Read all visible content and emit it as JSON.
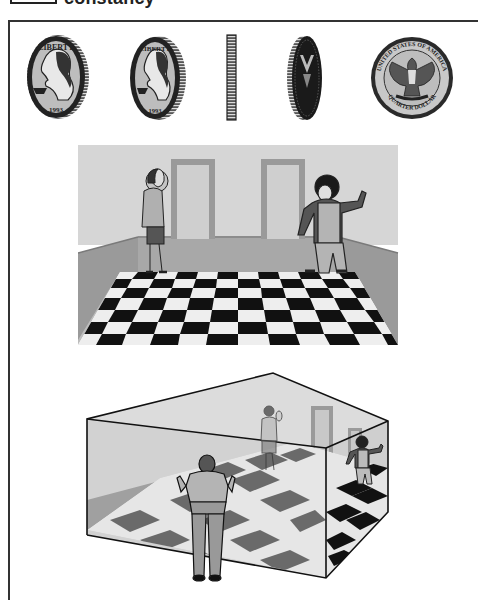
{
  "header": {
    "title": "constancy"
  },
  "figure": {
    "coins_panel": {
      "description": "Quarter dollar shown rotating from front view to edge to back view (shape constancy)",
      "coins": [
        {
          "view": "obverse-frontal",
          "inscription": "LIBERTY",
          "date": "1993"
        },
        {
          "view": "obverse-tilted",
          "inscription": "LIBERTY",
          "date": "1993"
        },
        {
          "view": "edge-on"
        },
        {
          "view": "reverse-tilted"
        },
        {
          "view": "reverse-frontal",
          "inscription_top": "UNITED STATES OF AMERICA",
          "inscription_bottom": "QUARTER DOLLAR"
        }
      ]
    },
    "room_panel": {
      "description": "Ames room as seen from viewing peephole: woman appears tiny, child appears giant",
      "figures": [
        "woman",
        "child"
      ]
    },
    "ames_room_panel": {
      "description": "Cutaway view of distorted Ames room with observer in foreground",
      "figures": [
        "observer",
        "woman",
        "child"
      ]
    }
  },
  "colors": {
    "ink": "#1a1a1a",
    "wall": "#d8d8d8",
    "wainscot": "#9a9a9a",
    "door": "#c4c4c4",
    "coin_face": "#b8b8b8",
    "tile_dark": "#111111",
    "tile_light": "#eeeeee"
  }
}
